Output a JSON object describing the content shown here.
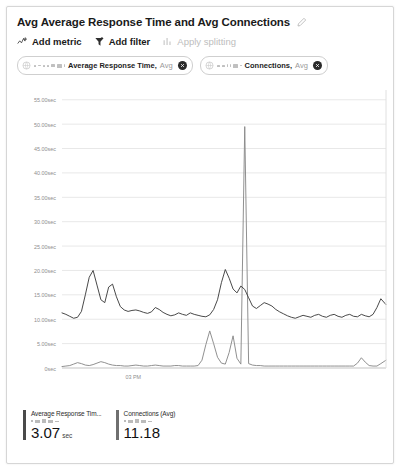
{
  "panel": {
    "title": "Avg Average Response Time and Avg Connections",
    "edit_icon": "pencil-icon"
  },
  "toolbar": {
    "items": [
      {
        "label": "Add metric",
        "icon": "add-metric-icon",
        "disabled": false
      },
      {
        "label": "Add filter",
        "icon": "filter-icon",
        "disabled": false
      },
      {
        "label": "Apply splitting",
        "icon": "splitting-icon",
        "disabled": true
      }
    ]
  },
  "metric_chips": [
    {
      "scope_icon": "scope-icon",
      "name": "Average Response Time,",
      "aggregation": "Avg",
      "close_icon": "close-icon"
    },
    {
      "scope_icon": "scope-icon",
      "name": "Connections,",
      "aggregation": "Avg",
      "close_icon": "close-icon"
    }
  ],
  "legend": [
    {
      "name": "Average Response Tim...",
      "value": "3.07",
      "unit": "sec",
      "color": "#4a4a4a"
    },
    {
      "name": "Connections (Avg)",
      "value": "11.18",
      "unit": "",
      "color": "#6f6f6f"
    }
  ],
  "chart_data": {
    "type": "line",
    "title": "Avg Average Response Time and Avg Connections",
    "xlabel": "",
    "ylabel": "",
    "grid": true,
    "legend_position": "bottom",
    "ylim": [
      0,
      57
    ],
    "yticks": [
      0,
      5,
      10,
      15,
      20,
      25,
      30,
      35,
      40,
      45,
      50,
      55
    ],
    "ytick_labels": [
      "0sec",
      "5.00sec",
      "10.00sec",
      "15.00sec",
      "20.00sec",
      "25.00sec",
      "30.00sec",
      "35.00sec",
      "40.00sec",
      "45.00sec",
      "50.00sec",
      "55.00sec"
    ],
    "xticks": [
      0.22
    ],
    "xtick_labels": [
      "03 PM"
    ],
    "series": [
      {
        "name": "Average Response Time (Avg)",
        "color": "#3f3f3f",
        "x": [
          0,
          0.012,
          0.024,
          0.036,
          0.048,
          0.06,
          0.072,
          0.084,
          0.096,
          0.108,
          0.12,
          0.132,
          0.144,
          0.156,
          0.168,
          0.18,
          0.192,
          0.204,
          0.216,
          0.228,
          0.24,
          0.252,
          0.264,
          0.276,
          0.288,
          0.3,
          0.312,
          0.324,
          0.336,
          0.348,
          0.36,
          0.372,
          0.384,
          0.396,
          0.408,
          0.42,
          0.432,
          0.444,
          0.456,
          0.468,
          0.48,
          0.492,
          0.504,
          0.516,
          0.528,
          0.54,
          0.552,
          0.564,
          0.576,
          0.588,
          0.6,
          0.612,
          0.624,
          0.636,
          0.648,
          0.66,
          0.672,
          0.684,
          0.696,
          0.708,
          0.72,
          0.732,
          0.744,
          0.756,
          0.768,
          0.78,
          0.792,
          0.804,
          0.816,
          0.828,
          0.84,
          0.852,
          0.864,
          0.876,
          0.888,
          0.9,
          0.912,
          0.924,
          0.936,
          0.948,
          0.96,
          0.972,
          0.984,
          1.0
        ],
        "values": [
          11.3,
          11.0,
          10.6,
          10.2,
          10.4,
          11.6,
          15.0,
          18.6,
          20.0,
          17.0,
          14.0,
          13.4,
          16.6,
          17.2,
          14.6,
          12.6,
          11.9,
          11.6,
          11.8,
          11.9,
          11.7,
          11.4,
          11.2,
          11.5,
          12.4,
          12.0,
          11.4,
          11.0,
          10.7,
          10.9,
          11.3,
          11.0,
          10.8,
          11.3,
          11.0,
          10.8,
          10.6,
          10.5,
          10.9,
          12.0,
          14.0,
          17.5,
          20.2,
          18.4,
          16.2,
          15.4,
          16.8,
          16.1,
          14.4,
          12.7,
          12.2,
          12.8,
          13.4,
          13.1,
          12.7,
          12.0,
          11.5,
          11.1,
          10.7,
          10.4,
          10.2,
          10.5,
          10.8,
          10.6,
          10.4,
          10.8,
          11.0,
          10.6,
          10.4,
          10.8,
          11.0,
          10.6,
          10.4,
          10.8,
          11.0,
          10.6,
          10.5,
          11.0,
          10.7,
          10.5,
          11.0,
          12.4,
          14.2,
          13.0
        ]
      },
      {
        "name": "Connections (Avg)",
        "color": "#8a8a8a",
        "x": [
          0,
          0.012,
          0.024,
          0.036,
          0.048,
          0.06,
          0.072,
          0.084,
          0.096,
          0.108,
          0.12,
          0.132,
          0.144,
          0.156,
          0.168,
          0.18,
          0.192,
          0.204,
          0.216,
          0.228,
          0.24,
          0.252,
          0.264,
          0.276,
          0.288,
          0.3,
          0.312,
          0.324,
          0.336,
          0.348,
          0.36,
          0.372,
          0.384,
          0.396,
          0.408,
          0.42,
          0.432,
          0.444,
          0.456,
          0.468,
          0.48,
          0.492,
          0.504,
          0.516,
          0.528,
          0.54,
          0.552,
          0.564,
          0.576,
          0.588,
          0.6,
          0.612,
          0.624,
          0.636,
          0.648,
          0.66,
          0.672,
          0.684,
          0.696,
          0.708,
          0.72,
          0.732,
          0.744,
          0.756,
          0.768,
          0.78,
          0.792,
          0.804,
          0.816,
          0.828,
          0.84,
          0.852,
          0.864,
          0.876,
          0.888,
          0.9,
          0.912,
          0.924,
          0.936,
          0.948,
          0.96,
          0.972,
          0.984,
          1.0
        ],
        "values": [
          0.3,
          0.4,
          0.5,
          0.8,
          1.1,
          0.9,
          0.6,
          0.5,
          0.7,
          1.0,
          1.3,
          1.1,
          0.8,
          0.6,
          0.5,
          0.5,
          0.4,
          0.4,
          0.5,
          0.6,
          0.5,
          0.4,
          0.4,
          0.5,
          0.6,
          0.5,
          0.4,
          0.4,
          0.4,
          0.5,
          0.5,
          0.4,
          0.4,
          0.4,
          0.4,
          0.5,
          1.6,
          4.8,
          7.6,
          5.0,
          2.2,
          1.0,
          0.8,
          3.2,
          6.6,
          2.0,
          0.8,
          49.5,
          0.9,
          0.6,
          0.5,
          0.5,
          0.4,
          0.4,
          0.4,
          0.4,
          0.4,
          0.4,
          0.4,
          0.4,
          0.4,
          0.4,
          0.4,
          0.4,
          0.4,
          0.4,
          0.4,
          0.4,
          0.4,
          0.4,
          0.4,
          0.4,
          0.4,
          0.4,
          0.4,
          0.4,
          1.0,
          2.1,
          1.2,
          0.5,
          0.4,
          0.4,
          0.9,
          1.6
        ]
      }
    ]
  }
}
